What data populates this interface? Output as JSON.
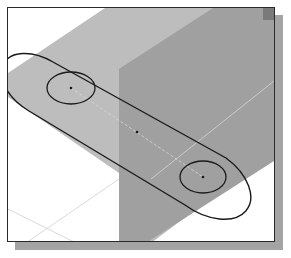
{
  "figure": {
    "description": "Isometric CAD sketch of a slot (obround) with two circular holes on a horizontal datum plane, with a vertical datum plane behind",
    "colors": {
      "background": "#ffffff",
      "frame_border": "#2a2a2a",
      "frame_shadow": "#a4a4a4",
      "horizontal_plane": "#bdbdbd",
      "vertical_plane": "#9d9d9d",
      "vertical_plane_corner": "#7a7a7a",
      "sketch_lines": "#1a1a1a",
      "construction_lines": "#d8d8d8",
      "grid_lines": "#cfcfcf"
    },
    "elements": {
      "slot_outline": "obround",
      "hole_left": "circle",
      "hole_right": "circle",
      "center_point_left": "point",
      "center_point_mid": "point",
      "center_point_right": "point",
      "centerline": "construction-line",
      "datum_plane_horizontal": "plane",
      "datum_plane_vertical": "plane",
      "axis_lines": "grid"
    }
  }
}
